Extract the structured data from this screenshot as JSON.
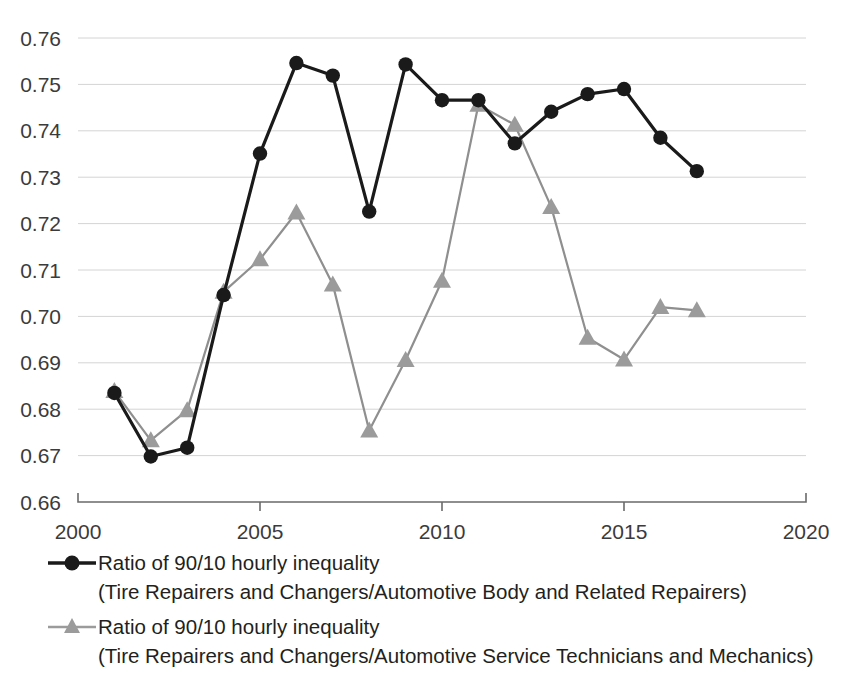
{
  "figure": {
    "clipped_top_text": "",
    "background_color": "#ffffff"
  },
  "axes": {
    "y_ticks": [
      "0.76",
      "0.75",
      "0.74",
      "0.73",
      "0.72",
      "0.71",
      "0.70",
      "0.69",
      "0.68",
      "0.67",
      "0.66"
    ],
    "x_ticks": [
      "2000",
      "2005",
      "2010",
      "2015",
      "2020"
    ]
  },
  "legend": {
    "items": [
      {
        "marker": "circle-marker",
        "color": "#1a1a1a",
        "line1": "Ratio of 90/10 hourly inequality",
        "line2": "(Tire Repairers and Changers/Automotive Body and Related Repairers)"
      },
      {
        "marker": "triangle-marker",
        "color": "#9b9b9b",
        "line1": "Ratio of 90/10 hourly inequality",
        "line2": "(Tire Repairers and Changers/Automotive Service Technicians and Mechanics)"
      }
    ]
  },
  "chart_data": {
    "type": "line",
    "title": "",
    "xlabel": "",
    "ylabel": "",
    "xlim": [
      2000,
      2020
    ],
    "ylim": [
      0.66,
      0.76
    ],
    "ytick_step": 0.01,
    "xtick_step": 5,
    "grid": "horizontal",
    "legend_position": "below-plot",
    "x": [
      2001,
      2002,
      2003,
      2004,
      2005,
      2006,
      2007,
      2008,
      2009,
      2010,
      2011,
      2012,
      2013,
      2014,
      2015,
      2016,
      2017
    ],
    "series": [
      {
        "name": "Ratio of 90/10 hourly inequality (Tire Repairers and Changers/Automotive Body and Related Repairers)",
        "marker": "circle",
        "color": "#1a1a1a",
        "values": [
          0.6835,
          0.6698,
          0.6717,
          0.7046,
          0.7351,
          0.7546,
          0.7519,
          0.7226,
          0.7543,
          0.7466,
          0.7466,
          0.7373,
          0.7441,
          0.7479,
          0.749,
          0.7385,
          0.7313
        ]
      },
      {
        "name": "Ratio of 90/10 hourly inequality (Tire Repairers and Changers/Automotive Service Technicians and Mechanics)",
        "marker": "triangle",
        "color": "#9b9b9b",
        "values": [
          0.6839,
          0.6733,
          0.6798,
          0.7053,
          0.7123,
          0.7224,
          0.7069,
          0.6754,
          0.6906,
          0.7077,
          0.7456,
          0.7413,
          0.7236,
          0.6954,
          0.6907,
          0.702,
          0.7013
        ]
      }
    ]
  }
}
